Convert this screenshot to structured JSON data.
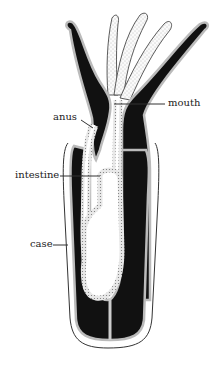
{
  "diagram": {
    "labels": {
      "mouth": "mouth",
      "anus": "anus",
      "intestine": "intestine",
      "case": "case"
    },
    "colors": {
      "tissue_dark": "#111111",
      "epithelium": "#dcdcdc",
      "outline": "#333333",
      "background": "#ffffff"
    }
  }
}
